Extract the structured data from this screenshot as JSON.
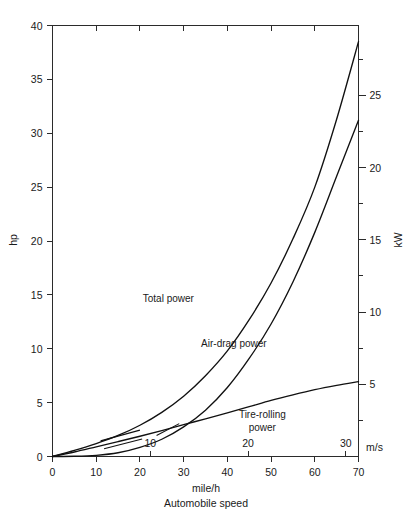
{
  "figure": {
    "background": "#ffffff",
    "ink_color": "#111111"
  },
  "chart_data": {
    "type": "line",
    "title": "",
    "xlabel_unit": "mile/h",
    "xlabel": "Automobile speed",
    "ylabel": "hp",
    "ylabel_right": "kW",
    "xlabel_secondary": "m/s",
    "grid": false,
    "legend": "inline-annotations",
    "xlim": [
      0,
      70
    ],
    "ylim": [
      0,
      40
    ],
    "ylim_right": [
      0,
      29.828
    ],
    "xlim_secondary_ms": [
      0,
      31.29
    ],
    "x_ticks": [
      0,
      10,
      20,
      30,
      40,
      50,
      60,
      70
    ],
    "x_ticklabels": [
      "0",
      "10",
      "20",
      "30",
      "40",
      "50",
      "60",
      "70"
    ],
    "x_ticks_secondary_ms": [
      10,
      20,
      30
    ],
    "x_ticklabels_secondary_ms": [
      "10",
      "20",
      "30"
    ],
    "y_ticks": [
      0,
      5,
      10,
      15,
      20,
      25,
      30,
      35,
      40
    ],
    "y_ticklabels": [
      "0",
      "5",
      "10",
      "15",
      "20",
      "25",
      "30",
      "35",
      "40"
    ],
    "y_ticks_right_kw": [
      5,
      10,
      15,
      20,
      25
    ],
    "y_ticklabels_right_kw": [
      "5",
      "10",
      "15",
      "20",
      "25"
    ],
    "y_minor_ticks_right_kw": [
      2.5,
      7.5,
      12.5,
      17.5,
      22.5,
      27.5
    ],
    "x": [
      0,
      5,
      10,
      15,
      20,
      25,
      30,
      35,
      40,
      45,
      50,
      55,
      60,
      65,
      70
    ],
    "series": [
      {
        "name": "Total power",
        "label": "Total power",
        "label_pos": {
          "x": 26.5,
          "y": 14.3
        },
        "values": [
          0,
          0.56,
          1.2,
          1.95,
          2.9,
          4.1,
          5.6,
          7.5,
          9.8,
          12.7,
          16.1,
          20.2,
          25.0,
          31.3,
          38.5
        ]
      },
      {
        "name": "Air-drag power",
        "label": "Air-drag power",
        "label_pos": {
          "x": 41.5,
          "y": 10.2
        },
        "values": [
          0,
          0.02,
          0.11,
          0.35,
          0.85,
          1.6,
          2.75,
          4.3,
          6.4,
          9.1,
          12.3,
          16.2,
          20.8,
          26.0,
          31.2
        ]
      },
      {
        "name": "Tire-rolling power",
        "label": "Tire-rolling power",
        "label_line1": "Tire-rolling",
        "label_line2": "power",
        "label_pos": {
          "x": 48.0,
          "y": 3.6
        },
        "values": [
          0,
          0.42,
          0.9,
          1.38,
          1.88,
          2.4,
          2.95,
          3.5,
          4.05,
          4.62,
          5.2,
          5.72,
          6.2,
          6.6,
          6.95
        ]
      }
    ]
  }
}
